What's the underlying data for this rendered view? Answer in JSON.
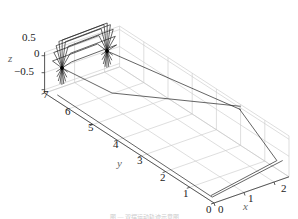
{
  "chart_data": {
    "type": "line",
    "title": "",
    "xlabel": "x",
    "ylabel": "y",
    "zlabel": "z",
    "x_ticks": [
      "0",
      "1",
      "2"
    ],
    "y_ticks": [
      "0",
      "1",
      "2",
      "3",
      "4",
      "5",
      "6",
      "7"
    ],
    "z_ticks": [
      "0.5",
      "0",
      "−0.5"
    ],
    "xlim": [
      0,
      2.5
    ],
    "ylim": [
      0,
      7
    ],
    "zlim": [
      -0.6,
      0.6
    ],
    "grid": true,
    "series": [
      {
        "name": "rotating frames",
        "count": 9,
        "pivot_left": [
          0,
          6.8,
          -0.3
        ],
        "pivot_right": [
          1.2,
          6.8,
          0.0
        ]
      },
      {
        "name": "long frame",
        "description": "rectangle extending from y≈7 to y≈0 along x≈0–2.5"
      }
    ]
  },
  "axes": {
    "z_ticks": [
      {
        "label": "0.5",
        "x": 22,
        "y": 32
      },
      {
        "label": "0",
        "x": 34,
        "y": 48
      },
      {
        "label": "−0.5",
        "x": 14,
        "y": 66
      }
    ],
    "y_ticks": [
      {
        "label": "7",
        "x": 43,
        "y": 89
      },
      {
        "label": "6",
        "x": 65,
        "y": 106
      },
      {
        "label": "5",
        "x": 88,
        "y": 122
      },
      {
        "label": "4",
        "x": 113,
        "y": 139
      },
      {
        "label": "3",
        "x": 137,
        "y": 155
      },
      {
        "label": "2",
        "x": 160,
        "y": 172
      },
      {
        "label": "1",
        "x": 183,
        "y": 188
      },
      {
        "label": "0",
        "x": 206,
        "y": 204
      }
    ],
    "x_ticks": [
      {
        "label": "0",
        "x": 218,
        "y": 204
      },
      {
        "label": "1",
        "x": 248,
        "y": 193
      },
      {
        "label": "2",
        "x": 281,
        "y": 183
      }
    ],
    "labels": {
      "z": {
        "text": "z",
        "x": 8,
        "y": 53
      },
      "y": {
        "text": "y",
        "x": 117,
        "y": 158
      },
      "x": {
        "text": "x",
        "x": 243,
        "y": 201
      }
    }
  },
  "caption": "图 — 双摆运动轨迹示意图"
}
